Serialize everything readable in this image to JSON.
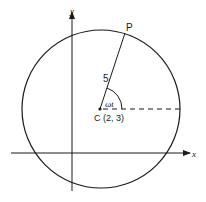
{
  "diagram": {
    "labels": {
      "y_axis": "y",
      "x_axis": "x",
      "point": "P",
      "radius": "5",
      "angle": "ωt",
      "center": "C (2, 3)"
    },
    "geometry": {
      "circle": {
        "cx": 101,
        "cy": 109,
        "r": 79
      },
      "center_dot": {
        "cx": 100,
        "cy": 109
      },
      "point_P": {
        "x": 125,
        "y": 33
      },
      "y_axis": {
        "x": 72,
        "y1": 191,
        "y2": 12
      },
      "x_axis": {
        "y": 153,
        "x1": 11,
        "x2": 190
      }
    },
    "colors": {
      "stroke": "#1a1a1a",
      "background": "#ffffff"
    }
  }
}
